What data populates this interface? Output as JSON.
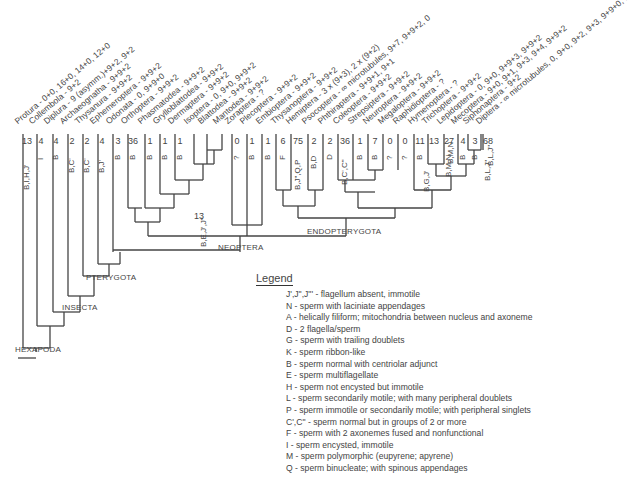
{
  "leaves": [
    {
      "name": "Protura - 0+0, 16+0, 14+0, 12+0",
      "count": "13",
      "codes": "B,I,H,J'",
      "x": 27
    },
    {
      "name": "Collembola - 9+2",
      "count": "4",
      "codes": "I",
      "x": 41
    },
    {
      "name": "Diplura - 9 (asymm.)+9+2, 9+2",
      "count": "4",
      "codes": "B",
      "x": 56
    },
    {
      "name": "Archaeognatha - 9+9+2",
      "count": "2",
      "codes": "B,C'",
      "x": 72
    },
    {
      "name": "Thysanura - 9+9+2",
      "count": "2",
      "codes": "B,C'",
      "x": 87
    },
    {
      "name": "Ephemeroptera - 9+9+2",
      "count": "4",
      "codes": "B,J'",
      "x": 102
    },
    {
      "name": "Odonata - 0, 9+9+0",
      "count": "3",
      "codes": "B",
      "x": 118
    },
    {
      "name": "Orthoptera - 9+9+2",
      "count": "36",
      "codes": "B",
      "x": 133
    },
    {
      "name": "Phasmatodea - 9+9+2",
      "count": "1",
      "codes": "B",
      "x": 150
    },
    {
      "name": "Grylloblattodea - 9+9+2",
      "count": "1",
      "codes": "B",
      "x": 165
    },
    {
      "name": "Dermaptera - 9+9+2",
      "count": "1",
      "codes": "B",
      "x": 180
    },
    {
      "name": "Isoptera - 0, 9+0, 9+9+2",
      "count": "",
      "codes": "",
      "x": 196
    },
    {
      "name": "Blattodea - 9+9+2",
      "count": "",
      "codes": "",
      "x": 210
    },
    {
      "name": "Mantodea - 9+9+2",
      "count": "",
      "codes": "",
      "x": 225
    },
    {
      "name": "Zoraptera - ?",
      "count": "0",
      "codes": "?",
      "x": 237
    },
    {
      "name": "Plecoptera - 9+9+2",
      "count": "1",
      "codes": "B",
      "x": 252
    },
    {
      "name": "Embioptera - 9+9+2",
      "count": "1",
      "codes": "B",
      "x": 268
    },
    {
      "name": "Thysanoptera - 9+9+2",
      "count": "6",
      "codes": "F",
      "x": 283
    },
    {
      "name": "Hemiptera - 3 x (9+3), 2 x (9+2)",
      "count": "75",
      "codes": "B,J\",Q,P",
      "x": 298
    },
    {
      "name": "Psocoptera - ∞ microtubules, 9+7, 9+9+2, 0",
      "count": "2",
      "codes": "B,D",
      "x": 314
    },
    {
      "name": "Phthiraptera - 9+9+1, 9+1",
      "count": "2",
      "codes": "D",
      "x": 330
    },
    {
      "name": "Coleoptera - 9+9+2",
      "count": "36",
      "codes": "B,C',C\"",
      "x": 345
    },
    {
      "name": "Strepsiptera - 9+9+2",
      "count": "1",
      "codes": "B",
      "x": 360
    },
    {
      "name": "Neuroptera - 9+9+2",
      "count": "7",
      "codes": "B",
      "x": 375
    },
    {
      "name": "Megaloptera - 9+9+2",
      "count": "0",
      "codes": "?",
      "x": 390
    },
    {
      "name": "Raphidioptera - ?",
      "count": "0",
      "codes": "?",
      "x": 405
    },
    {
      "name": "Hymenoptera - ?",
      "count": "11",
      "codes": "B",
      "x": 420
    },
    {
      "name": "Trichoptera - 9+9+2",
      "count": "13",
      "codes": "",
      "x": 434
    },
    {
      "name": "Lepidoptera - 0, 9+0, 9+9+3, 9+9+2",
      "count": "27",
      "codes": "B,M,N",
      "x": 449
    },
    {
      "name": "Mecoptera - 9+0, 9+1, 9+3, 9+4, 9+9+2",
      "count": "4",
      "codes": "B",
      "x": 463
    },
    {
      "name": "Siphonaptera - 9+2",
      "count": "3",
      "codes": "B",
      "x": 475
    },
    {
      "name": "Diptera - ∞ microtubules, 0, 9+0, 9+2, 9+3, 9+9+0, 9+9+1, 9+9+3, 9+9+2",
      "count": "68",
      "codes": "B,L,J\"",
      "x": 488
    }
  ],
  "node_annotations": [
    {
      "label": "13",
      "x": 194,
      "y": 211
    },
    {
      "label": "B,E,J',J\"",
      "x": 199,
      "y": 247,
      "rotated": true
    },
    {
      "label": "B,G,J'",
      "x": 422,
      "y": 192,
      "rotated": true
    },
    {
      "label": "B,M,N",
      "x": 446,
      "y": 164,
      "rotated": true
    },
    {
      "label": "B,L,J\"",
      "x": 486,
      "y": 166,
      "rotated": true
    }
  ],
  "clades": [
    {
      "name": "NEOPTERA",
      "x": 218,
      "y": 243
    },
    {
      "name": "ENDOPTERYGOTA",
      "x": 307,
      "y": 227
    },
    {
      "name": "PTERYGOTA",
      "x": 86,
      "y": 273
    },
    {
      "name": "INSECTA",
      "x": 62,
      "y": 303
    },
    {
      "name": "HEXAPODA",
      "x": 15,
      "y": 345
    }
  ],
  "legend": {
    "title": "Legend",
    "items": [
      "J',J\",J\"' - flagellum absent, immotile",
      "N - sperm with laciniate appendages",
      "A - helically filiform; mitochondria between nucleus and axoneme",
      "D - 2 flagella/sperm",
      "G - sperm with trailing doublets",
      "K - sperm ribbon-like",
      "B - sperm normal with centriolar adjunct",
      "E - sperm multiflagellate",
      "H - sperm not encysted but immotile",
      "L - sperm secondarily motile; with many peripheral doublets",
      "P - sperm immotile or secondarily motile; with peripheral singlets",
      "C',C\" - sperm normal but in groups of 2 or more",
      "F - sperm with 2 axonemes fused and nonfunctional",
      "I - sperm encysted, immotile",
      "M - sperm polymorphic (eupyrene; apyrene)",
      "Q - sperm binucleate; with spinous appendages"
    ]
  },
  "colors": {
    "line": "#444444",
    "text": "#444444",
    "background": "#ffffff"
  }
}
